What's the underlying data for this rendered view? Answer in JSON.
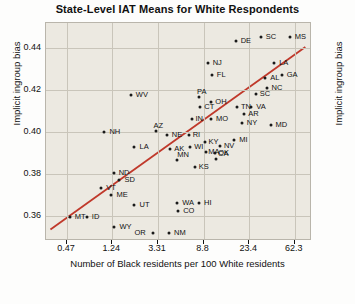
{
  "chart_data": {
    "type": "scatter",
    "title": "State-Level IAT Means for White Respondents",
    "xlabel": "Number of Black residents per 100 White residents",
    "ylabel": "Implicit ingroup bias",
    "ylabel_right": "Implicit ingroup bias",
    "xscale": "log",
    "xticks": [
      "0.47",
      "1.24",
      "3.31",
      "8.8",
      "23.4",
      "62.3"
    ],
    "xtick_values": [
      0.47,
      1.24,
      3.31,
      8.8,
      23.4,
      62.3
    ],
    "yticks": [
      "0.36",
      "0.38",
      "0.40",
      "0.42",
      "0.44"
    ],
    "ytick_values": [
      0.36,
      0.38,
      0.4,
      0.42,
      0.44
    ],
    "xlim": [
      0.3,
      90
    ],
    "ylim": [
      0.348,
      0.452
    ],
    "grid": true,
    "grid_color": "#c9c5ba",
    "plot_bg": "#ece9e1",
    "point_color": "#1a1a1a",
    "fit_line_color": "#c0392b",
    "fit_line": {
      "x0": 0.33,
      "y0": 0.3535,
      "x1": 78.0,
      "y1": 0.4405
    },
    "points": [
      {
        "label": "DE",
        "x": 17.5,
        "y": 0.4435,
        "lx": 5,
        "ly": -4
      },
      {
        "label": "SC",
        "x": 30.0,
        "y": 0.4455,
        "lx": 5,
        "ly": -4
      },
      {
        "label": "MS",
        "x": 56.0,
        "y": 0.4455,
        "lx": 5,
        "ly": -4
      },
      {
        "label": "NJ",
        "x": 9.6,
        "y": 0.433,
        "lx": 5,
        "ly": -4
      },
      {
        "label": "LA",
        "x": 40.0,
        "y": 0.433,
        "lx": 5,
        "ly": -4
      },
      {
        "label": "FL",
        "x": 10.5,
        "y": 0.427,
        "lx": 5,
        "ly": -4
      },
      {
        "label": "AL",
        "x": 33.0,
        "y": 0.426,
        "lx": 5,
        "ly": -4
      },
      {
        "label": "GA",
        "x": 47.0,
        "y": 0.427,
        "lx": 5,
        "ly": -4
      },
      {
        "label": "SC2",
        "x": 27.0,
        "y": 0.418,
        "lx": 4,
        "ly": -4
      },
      {
        "label": "NC",
        "x": 34.0,
        "y": 0.421,
        "lx": 5,
        "ly": -4
      },
      {
        "label": "WV",
        "x": 1.85,
        "y": 0.4175,
        "lx": 5,
        "ly": -4
      },
      {
        "label": "PA",
        "x": 8.0,
        "y": 0.4165,
        "lx": -2,
        "ly": -9
      },
      {
        "label": "OH",
        "x": 10.4,
        "y": 0.4145,
        "lx": 4,
        "ly": -4
      },
      {
        "label": "CT",
        "x": 8.2,
        "y": 0.412,
        "lx": 4,
        "ly": -4
      },
      {
        "label": "TN",
        "x": 18.0,
        "y": 0.412,
        "lx": 4,
        "ly": -4
      },
      {
        "label": "VA",
        "x": 24.5,
        "y": 0.412,
        "lx": 5,
        "ly": -4
      },
      {
        "label": "AR",
        "x": 21.0,
        "y": 0.4085,
        "lx": 4,
        "ly": -4
      },
      {
        "label": "MO",
        "x": 10.3,
        "y": 0.406,
        "lx": 5,
        "ly": -4
      },
      {
        "label": "NY",
        "x": 20.0,
        "y": 0.4045,
        "lx": 5,
        "ly": -4
      },
      {
        "label": "IN",
        "x": 6.8,
        "y": 0.406,
        "lx": 4,
        "ly": -4
      },
      {
        "label": "MD",
        "x": 37.0,
        "y": 0.4035,
        "lx": 5,
        "ly": -4
      },
      {
        "label": "AZ",
        "x": 3.2,
        "y": 0.4005,
        "lx": -3,
        "ly": -9
      },
      {
        "label": "NE",
        "x": 4.0,
        "y": 0.3985,
        "lx": 5,
        "ly": -4
      },
      {
        "label": "RI",
        "x": 6.4,
        "y": 0.3985,
        "lx": 4,
        "ly": -4
      },
      {
        "label": "MI",
        "x": 17.0,
        "y": 0.396,
        "lx": 5,
        "ly": -4
      },
      {
        "label": "NH",
        "x": 1.05,
        "y": 0.4,
        "lx": 5,
        "ly": -4
      },
      {
        "label": "LA2",
        "x": 2.0,
        "y": 0.393,
        "lx": 5,
        "ly": -4
      },
      {
        "label": "AK",
        "x": 4.3,
        "y": 0.392,
        "lx": 4,
        "ly": -4
      },
      {
        "label": "WI",
        "x": 6.6,
        "y": 0.393,
        "lx": 4,
        "ly": -4
      },
      {
        "label": "KY",
        "x": 9.0,
        "y": 0.395,
        "lx": 4,
        "ly": -4
      },
      {
        "label": "NV",
        "x": 12.5,
        "y": 0.3935,
        "lx": 4,
        "ly": -4
      },
      {
        "label": "MA",
        "x": 9.3,
        "y": 0.3905,
        "lx": 2,
        "ly": -4
      },
      {
        "label": "OK",
        "x": 11.3,
        "y": 0.39,
        "lx": 3,
        "ly": -4
      },
      {
        "label": "MN",
        "x": 5.0,
        "y": 0.3865,
        "lx": 0,
        "ly": -9
      },
      {
        "label": "CA",
        "x": 11.5,
        "y": 0.387,
        "lx": 2,
        "ly": -9
      },
      {
        "label": "KS",
        "x": 7.3,
        "y": 0.3835,
        "lx": 4,
        "ly": -4
      },
      {
        "label": "ND",
        "x": 1.28,
        "y": 0.3805,
        "lx": 5,
        "ly": -4
      },
      {
        "label": "SD",
        "x": 1.45,
        "y": 0.377,
        "lx": 5,
        "ly": -4
      },
      {
        "label": "VT",
        "x": 0.98,
        "y": 0.3735,
        "lx": 5,
        "ly": -4
      },
      {
        "label": "ME",
        "x": 1.22,
        "y": 0.37,
        "lx": 5,
        "ly": -4
      },
      {
        "label": "UT",
        "x": 2.0,
        "y": 0.365,
        "lx": 5,
        "ly": -4
      },
      {
        "label": "MT",
        "x": 0.5,
        "y": 0.3595,
        "lx": 5,
        "ly": -4
      },
      {
        "label": "ID",
        "x": 0.72,
        "y": 0.3595,
        "lx": 5,
        "ly": -4
      },
      {
        "label": "WY",
        "x": 1.3,
        "y": 0.3545,
        "lx": 5,
        "ly": -4
      },
      {
        "label": "WA",
        "x": 5.0,
        "y": 0.366,
        "lx": 5,
        "ly": -4
      },
      {
        "label": "HI",
        "x": 8.0,
        "y": 0.366,
        "lx": 5,
        "ly": -4
      },
      {
        "label": "CO",
        "x": 5.1,
        "y": 0.3625,
        "lx": 5,
        "ly": -4
      },
      {
        "label": "OR",
        "x": 3.0,
        "y": 0.352,
        "lx": -19,
        "ly": -4
      },
      {
        "label": "NM",
        "x": 4.2,
        "y": 0.352,
        "lx": 5,
        "ly": -4
      }
    ]
  }
}
